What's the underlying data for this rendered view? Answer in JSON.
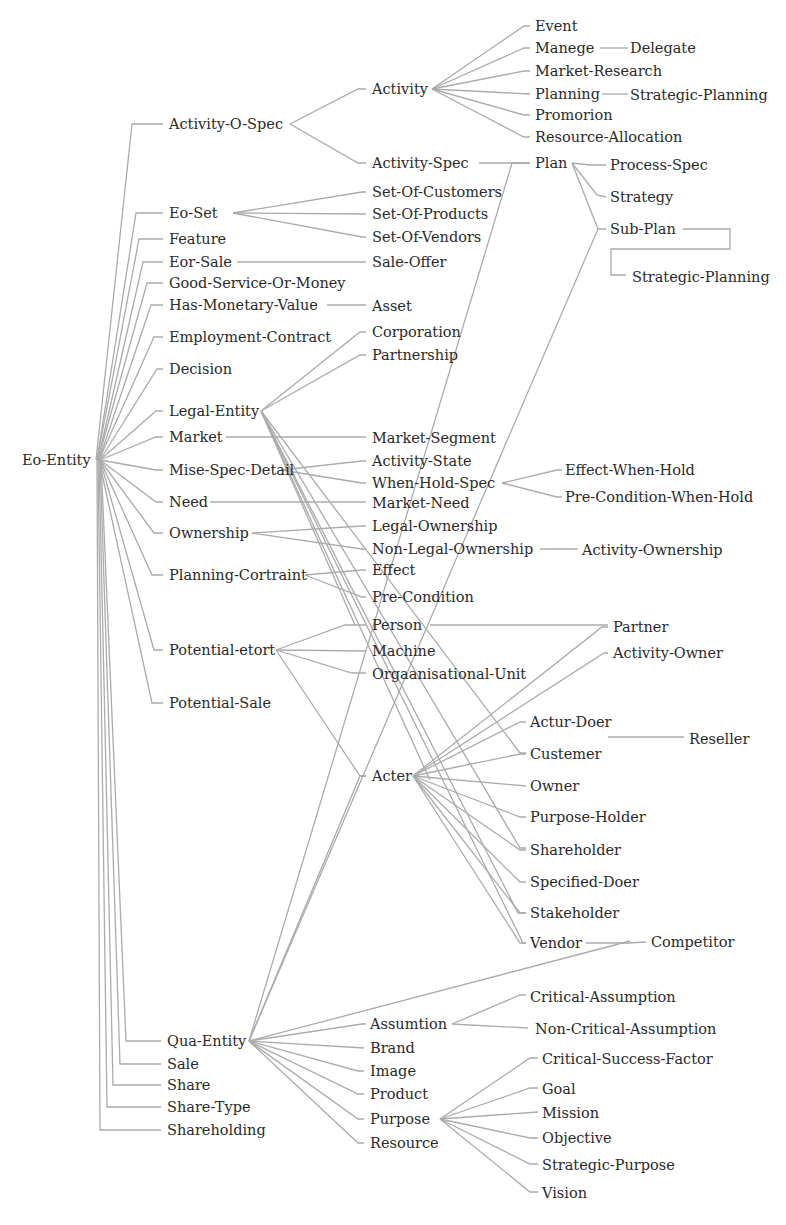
{
  "diagram": {
    "type": "ontology-tree",
    "line_color": "#ababab",
    "text_color": "#2a2a2a",
    "nodes": [
      {
        "id": "eo-entity",
        "label": "Eo-Entity",
        "x": 22,
        "y": 460
      },
      {
        "id": "activity-o-spec",
        "label": "Activity-O-Spec",
        "x": 169,
        "y": 124
      },
      {
        "id": "eo-set",
        "label": "Eo-Set",
        "x": 169,
        "y": 213
      },
      {
        "id": "feature",
        "label": "Feature",
        "x": 169,
        "y": 239
      },
      {
        "id": "eor-sale",
        "label": "Eor-Sale",
        "x": 169,
        "y": 262
      },
      {
        "id": "good-service-or-money",
        "label": "Good-Service-Or-Money",
        "x": 169,
        "y": 283
      },
      {
        "id": "has-monetary-value",
        "label": "Has-Monetary-Value",
        "x": 169,
        "y": 305
      },
      {
        "id": "employment-contract",
        "label": "Employment-Contract",
        "x": 169,
        "y": 337
      },
      {
        "id": "decision",
        "label": "Decision",
        "x": 169,
        "y": 369
      },
      {
        "id": "legal-entity",
        "label": "Legal-Entity",
        "x": 169,
        "y": 411
      },
      {
        "id": "market",
        "label": "Market",
        "x": 169,
        "y": 437
      },
      {
        "id": "mise-spec-detail",
        "label": "Mise-Spec-Detail",
        "x": 169,
        "y": 470
      },
      {
        "id": "need",
        "label": "Need",
        "x": 169,
        "y": 502
      },
      {
        "id": "ownership",
        "label": "Ownership",
        "x": 169,
        "y": 533
      },
      {
        "id": "planning-cortraint",
        "label": "Planning-Cortraint",
        "x": 169,
        "y": 575
      },
      {
        "id": "potential-etort",
        "label": "Potential-etort",
        "x": 169,
        "y": 650
      },
      {
        "id": "potential-sale",
        "label": "Potential-Sale",
        "x": 169,
        "y": 703
      },
      {
        "id": "qua-entity",
        "label": "Qua-Entity",
        "x": 167,
        "y": 1041
      },
      {
        "id": "sale",
        "label": "Sale",
        "x": 167,
        "y": 1064
      },
      {
        "id": "share",
        "label": "Share",
        "x": 167,
        "y": 1085
      },
      {
        "id": "share-type",
        "label": "Share-Type",
        "x": 167,
        "y": 1107
      },
      {
        "id": "shareholding",
        "label": "Shareholding",
        "x": 167,
        "y": 1130
      },
      {
        "id": "activity",
        "label": "Activity",
        "x": 372,
        "y": 89
      },
      {
        "id": "activity-spec",
        "label": "Activity-Spec",
        "x": 372,
        "y": 163
      },
      {
        "id": "set-of-customers",
        "label": "Set-Of-Customers",
        "x": 372,
        "y": 192
      },
      {
        "id": "set-of-products",
        "label": "Set-Of-Products",
        "x": 372,
        "y": 214
      },
      {
        "id": "set-of-vendors",
        "label": "Set-Of-Vendors",
        "x": 372,
        "y": 237
      },
      {
        "id": "sale-offer",
        "label": "Sale-Offer",
        "x": 372,
        "y": 262
      },
      {
        "id": "asset",
        "label": "Asset",
        "x": 372,
        "y": 306
      },
      {
        "id": "corporation",
        "label": "Corporation",
        "x": 372,
        "y": 332
      },
      {
        "id": "partnership",
        "label": "Partnership",
        "x": 372,
        "y": 355
      },
      {
        "id": "market-segment",
        "label": "Market-Segment",
        "x": 372,
        "y": 438
      },
      {
        "id": "activity-state",
        "label": "Activity-State",
        "x": 372,
        "y": 461
      },
      {
        "id": "when-hold-spec",
        "label": "When-Hold-Spec",
        "x": 372,
        "y": 483
      },
      {
        "id": "market-need",
        "label": "Market-Need",
        "x": 372,
        "y": 503
      },
      {
        "id": "legal-ownership",
        "label": "Legal-Ownership",
        "x": 372,
        "y": 526
      },
      {
        "id": "non-legal-ownership",
        "label": "Non-Legal-Ownership",
        "x": 372,
        "y": 549
      },
      {
        "id": "effect",
        "label": "Effect",
        "x": 372,
        "y": 570
      },
      {
        "id": "pre-condition",
        "label": "Pre-Condition",
        "x": 372,
        "y": 597
      },
      {
        "id": "person",
        "label": "Person",
        "x": 372,
        "y": 625
      },
      {
        "id": "machine",
        "label": "Machine",
        "x": 372,
        "y": 651
      },
      {
        "id": "orgaanisational-unit",
        "label": "Orgaanisational-Unit",
        "x": 372,
        "y": 674
      },
      {
        "id": "acter",
        "label": "Acter",
        "x": 372,
        "y": 776
      },
      {
        "id": "assumtion",
        "label": "Assumtion",
        "x": 370,
        "y": 1024
      },
      {
        "id": "brand",
        "label": "Brand",
        "x": 370,
        "y": 1048
      },
      {
        "id": "image",
        "label": "Image",
        "x": 370,
        "y": 1071
      },
      {
        "id": "product",
        "label": "Product",
        "x": 370,
        "y": 1094
      },
      {
        "id": "purpose",
        "label": "Purpose",
        "x": 370,
        "y": 1119
      },
      {
        "id": "resource",
        "label": "Resource",
        "x": 370,
        "y": 1143
      },
      {
        "id": "event",
        "label": "Event",
        "x": 535,
        "y": 26
      },
      {
        "id": "manege",
        "label": "Manege",
        "x": 535,
        "y": 48
      },
      {
        "id": "delegate",
        "label": "Delegate",
        "x": 630,
        "y": 48
      },
      {
        "id": "market-research",
        "label": "Market-Research",
        "x": 535,
        "y": 71
      },
      {
        "id": "planning",
        "label": "Planning",
        "x": 535,
        "y": 94
      },
      {
        "id": "strategic-planning-1",
        "label": "Strategic-Planning",
        "x": 630,
        "y": 95
      },
      {
        "id": "promorion",
        "label": "Promorion",
        "x": 535,
        "y": 115
      },
      {
        "id": "resource-allocation",
        "label": "Resource-Allocation",
        "x": 535,
        "y": 137
      },
      {
        "id": "plan",
        "label": "Plan",
        "x": 535,
        "y": 163
      },
      {
        "id": "process-spec",
        "label": "Process-Spec",
        "x": 610,
        "y": 165
      },
      {
        "id": "strategy",
        "label": "Strategy",
        "x": 610,
        "y": 197
      },
      {
        "id": "sub-plan",
        "label": "Sub-Plan",
        "x": 610,
        "y": 229
      },
      {
        "id": "strategic-planning-2",
        "label": "Strategic-Planning",
        "x": 632,
        "y": 277
      },
      {
        "id": "effect-when-hold",
        "label": "Effect-When-Hold",
        "x": 565,
        "y": 470
      },
      {
        "id": "pre-condition-when-hold",
        "label": "Pre-Condition-When-Hold",
        "x": 565,
        "y": 497
      },
      {
        "id": "activity-ownership",
        "label": "Activity-Ownership",
        "x": 582,
        "y": 550
      },
      {
        "id": "partner",
        "label": "Partner",
        "x": 613,
        "y": 627
      },
      {
        "id": "activity-owner",
        "label": "Activity-Owner",
        "x": 613,
        "y": 653
      },
      {
        "id": "actur-doer",
        "label": "Actur-Doer",
        "x": 530,
        "y": 722
      },
      {
        "id": "reseller",
        "label": "Reseller",
        "x": 689,
        "y": 739
      },
      {
        "id": "custemer",
        "label": "Custemer",
        "x": 530,
        "y": 754
      },
      {
        "id": "owner",
        "label": "Owner",
        "x": 530,
        "y": 786
      },
      {
        "id": "purpose-holder",
        "label": "Purpose-Holder",
        "x": 530,
        "y": 817
      },
      {
        "id": "shareholder",
        "label": "Shareholder",
        "x": 530,
        "y": 850
      },
      {
        "id": "specified-doer",
        "label": "Specified-Doer",
        "x": 530,
        "y": 882
      },
      {
        "id": "stakeholder",
        "label": "Stakeholder",
        "x": 530,
        "y": 913
      },
      {
        "id": "vendor",
        "label": "Vendor",
        "x": 530,
        "y": 943
      },
      {
        "id": "competitor",
        "label": "Competitor",
        "x": 651,
        "y": 942
      },
      {
        "id": "critical-assumption",
        "label": "Critical-Assumption",
        "x": 530,
        "y": 997
      },
      {
        "id": "non-critical-assumption",
        "label": "Non-Critical-Assumption",
        "x": 535,
        "y": 1029
      },
      {
        "id": "critical-success-factor",
        "label": "Critical-Success-Factor",
        "x": 542,
        "y": 1059
      },
      {
        "id": "goal",
        "label": "Goal",
        "x": 542,
        "y": 1089
      },
      {
        "id": "mission",
        "label": "Mission",
        "x": 542,
        "y": 1113
      },
      {
        "id": "objective",
        "label": "Objective",
        "x": 542,
        "y": 1138
      },
      {
        "id": "strategic-purpose",
        "label": "Strategic-Purpose",
        "x": 542,
        "y": 1165
      },
      {
        "id": "vision",
        "label": "Vision",
        "x": 542,
        "y": 1193
      }
    ]
  }
}
